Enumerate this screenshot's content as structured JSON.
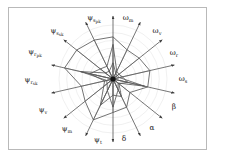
{
  "figure": {
    "kind": "radar-chart",
    "background": "#ffffff",
    "frame_color": "#b9b9b9",
    "grid_color": "#d8d8d8",
    "axis_color": "#4a4a4a",
    "series_color": "#5a5a5a",
    "center": {
      "x": 113,
      "y": 79
    },
    "radius": 54
  },
  "chart_data": {
    "type": "radar",
    "title": "",
    "xlabel": "",
    "ylabel": "",
    "grid": true,
    "legend": "none",
    "rings": 7,
    "rlim": [
      0,
      1
    ],
    "categories": [
      "ψ_s_pk",
      "ω_m",
      "ω_v",
      "ω_r",
      "ω_s",
      "β",
      "α",
      "δ",
      "ψ_t",
      "ψ_m",
      "ψ_v",
      "ψ_r_sk",
      "ψ_r_pk",
      "ψ_s_sk"
    ],
    "tick_labels": [
      {
        "id": "psi_s_pk",
        "base": "ψ",
        "sub": "s",
        "sub2": "pk",
        "angle_deg": 90,
        "x": 94,
        "y": 18
      },
      {
        "id": "omega_m",
        "base": "ω",
        "sub": "m",
        "sub2": "",
        "angle_deg": 64.3,
        "x": 128,
        "y": 18
      },
      {
        "id": "omega_v",
        "base": "ω",
        "sub": "v",
        "sub2": "",
        "angle_deg": 38.6,
        "x": 157,
        "y": 31
      },
      {
        "id": "omega_r",
        "base": "ω",
        "sub": "r",
        "sub2": "",
        "angle_deg": 12.9,
        "x": 174,
        "y": 53
      },
      {
        "id": "omega_s",
        "base": "ω",
        "sub": "s",
        "sub2": "",
        "angle_deg": 0,
        "x": 183,
        "y": 79
      },
      {
        "id": "beta",
        "base": "β",
        "sub": "",
        "sub2": "",
        "angle_deg": -25.7,
        "x": 174,
        "y": 107
      },
      {
        "id": "alpha",
        "base": "α",
        "sub": "",
        "sub2": "",
        "angle_deg": -51.4,
        "x": 152,
        "y": 128
      },
      {
        "id": "delta",
        "base": "δ",
        "sub": "",
        "sub2": "",
        "angle_deg": -77.1,
        "x": 124,
        "y": 139
      },
      {
        "id": "psi_t",
        "base": "ψ",
        "sub": "t",
        "sub2": "",
        "angle_deg": -102.9,
        "x": 98,
        "y": 140
      },
      {
        "id": "psi_m",
        "base": "ψ",
        "sub": "m",
        "sub2": "",
        "angle_deg": -128.6,
        "x": 67,
        "y": 129
      },
      {
        "id": "psi_v",
        "base": "ψ",
        "sub": "v",
        "sub2": "",
        "angle_deg": -154.3,
        "x": 43,
        "y": 110
      },
      {
        "id": "psi_r_sk",
        "base": "ψ",
        "sub": "r",
        "sub2": "sk",
        "angle_deg": 180,
        "x": 31,
        "y": 80
      },
      {
        "id": "psi_r_pk",
        "base": "ψ",
        "sub": "r",
        "sub2": "pk",
        "angle_deg": 154.3,
        "x": 35,
        "y": 52
      },
      {
        "id": "psi_s_sk",
        "base": "ψ",
        "sub": "s",
        "sub2": "sk",
        "angle_deg": 128.6,
        "x": 57,
        "y": 31
      }
    ],
    "series": [
      {
        "name": "outer",
        "values": [
          0.78,
          0.6,
          0.62,
          0.7,
          0.66,
          0.4,
          0.58,
          0.62,
          0.84,
          0.66,
          0.6,
          0.92,
          0.86,
          0.8
        ]
      },
      {
        "name": "inner",
        "values": [
          0.64,
          0.16,
          0.14,
          0.18,
          0.28,
          0.14,
          0.36,
          0.3,
          0.54,
          0.22,
          0.16,
          0.44,
          0.3,
          0.26
        ]
      },
      {
        "name": "middle",
        "values": [
          0.3,
          0.12,
          0.1,
          0.12,
          0.6,
          0.12,
          0.22,
          0.52,
          0.24,
          0.14,
          0.12,
          0.62,
          0.18,
          0.16
        ]
      }
    ]
  }
}
